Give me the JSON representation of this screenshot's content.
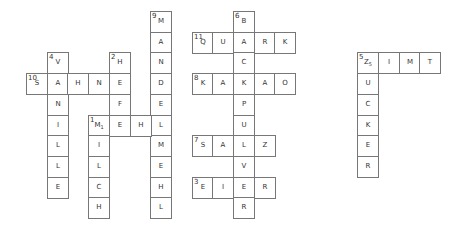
{
  "grid": {
    "cell_size": 20.7,
    "origin": {
      "x": 26,
      "y": 11
    },
    "cells": [
      {
        "c": 6,
        "r": 0,
        "ch": "M",
        "num": "9"
      },
      {
        "c": 6,
        "r": 1,
        "ch": "A"
      },
      {
        "c": 6,
        "r": 2,
        "ch": "N"
      },
      {
        "c": 6,
        "r": 3,
        "ch": "D"
      },
      {
        "c": 6,
        "r": 4,
        "ch": "E"
      },
      {
        "c": 6,
        "r": 5,
        "ch": "L"
      },
      {
        "c": 6,
        "r": 6,
        "ch": "M"
      },
      {
        "c": 6,
        "r": 7,
        "ch": "E"
      },
      {
        "c": 6,
        "r": 8,
        "ch": "H"
      },
      {
        "c": 6,
        "r": 9,
        "ch": "L"
      },
      {
        "c": 0,
        "r": 3,
        "ch": "S",
        "num": "10"
      },
      {
        "c": 1,
        "r": 3,
        "ch": "A"
      },
      {
        "c": 2,
        "r": 3,
        "ch": "H"
      },
      {
        "c": 3,
        "r": 3,
        "ch": "N"
      },
      {
        "c": 4,
        "r": 3,
        "ch": "E"
      },
      {
        "c": 1,
        "r": 2,
        "ch": "V",
        "num": "4"
      },
      {
        "c": 1,
        "r": 4,
        "ch": "N"
      },
      {
        "c": 1,
        "r": 5,
        "ch": "I"
      },
      {
        "c": 1,
        "r": 6,
        "ch": "L"
      },
      {
        "c": 1,
        "r": 7,
        "ch": "L"
      },
      {
        "c": 1,
        "r": 8,
        "ch": "E"
      },
      {
        "c": 4,
        "r": 2,
        "ch": "H",
        "num": "2"
      },
      {
        "c": 4,
        "r": 4,
        "ch": "F"
      },
      {
        "c": 3,
        "r": 5,
        "ch": "M",
        "num": "1",
        "sub": "1"
      },
      {
        "c": 4,
        "r": 5,
        "ch": "E"
      },
      {
        "c": 5,
        "r": 5,
        "ch": "H"
      },
      {
        "c": 3,
        "r": 6,
        "ch": "I"
      },
      {
        "c": 3,
        "r": 7,
        "ch": "L"
      },
      {
        "c": 3,
        "r": 8,
        "ch": "C"
      },
      {
        "c": 3,
        "r": 9,
        "ch": "H"
      },
      {
        "c": 10,
        "r": 0,
        "ch": "B",
        "num": "6"
      },
      {
        "c": 8,
        "r": 1,
        "ch": "Q",
        "num": "11"
      },
      {
        "c": 9,
        "r": 1,
        "ch": "U"
      },
      {
        "c": 10,
        "r": 1,
        "ch": "A"
      },
      {
        "c": 11,
        "r": 1,
        "ch": "R"
      },
      {
        "c": 12,
        "r": 1,
        "ch": "K"
      },
      {
        "c": 10,
        "r": 2,
        "ch": "C"
      },
      {
        "c": 8,
        "r": 3,
        "ch": "K",
        "num": "8"
      },
      {
        "c": 9,
        "r": 3,
        "ch": "A"
      },
      {
        "c": 10,
        "r": 3,
        "ch": "K"
      },
      {
        "c": 11,
        "r": 3,
        "ch": "A"
      },
      {
        "c": 12,
        "r": 3,
        "ch": "O"
      },
      {
        "c": 10,
        "r": 4,
        "ch": "P"
      },
      {
        "c": 10,
        "r": 5,
        "ch": "U"
      },
      {
        "c": 8,
        "r": 6,
        "ch": "S",
        "num": "7"
      },
      {
        "c": 9,
        "r": 6,
        "ch": "A"
      },
      {
        "c": 10,
        "r": 6,
        "ch": "L"
      },
      {
        "c": 11,
        "r": 6,
        "ch": "Z"
      },
      {
        "c": 10,
        "r": 7,
        "ch": "V"
      },
      {
        "c": 8,
        "r": 8,
        "ch": "E",
        "num": "3"
      },
      {
        "c": 9,
        "r": 8,
        "ch": "I"
      },
      {
        "c": 10,
        "r": 8,
        "ch": "E"
      },
      {
        "c": 11,
        "r": 8,
        "ch": "R"
      },
      {
        "c": 10,
        "r": 9,
        "ch": "R"
      },
      {
        "c": 16,
        "r": 2,
        "ch": "Z",
        "num": "5",
        "sub": "5"
      },
      {
        "c": 17,
        "r": 2,
        "ch": "I"
      },
      {
        "c": 18,
        "r": 2,
        "ch": "M"
      },
      {
        "c": 19,
        "r": 2,
        "ch": "T"
      },
      {
        "c": 16,
        "r": 3,
        "ch": "U"
      },
      {
        "c": 16,
        "r": 4,
        "ch": "C"
      },
      {
        "c": 16,
        "r": 5,
        "ch": "K"
      },
      {
        "c": 16,
        "r": 6,
        "ch": "E"
      },
      {
        "c": 16,
        "r": 7,
        "ch": "R"
      }
    ]
  }
}
